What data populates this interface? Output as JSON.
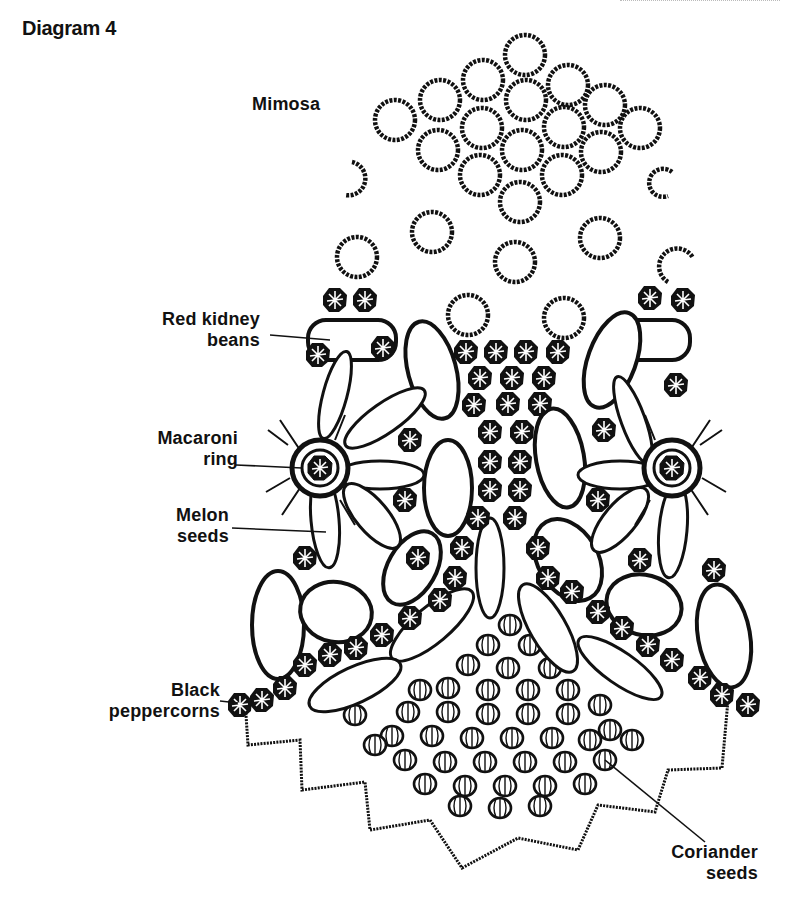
{
  "title": "Diagram 4",
  "labels": {
    "mimosa": {
      "lines": [
        "Mimosa"
      ]
    },
    "red_kidney_beans": {
      "lines": [
        "Red kidney",
        "beans"
      ]
    },
    "macaroni_ring": {
      "lines": [
        "Macaroni",
        "ring"
      ]
    },
    "melon_seeds": {
      "lines": [
        "Melon",
        "seeds"
      ]
    },
    "black_peppercorns": {
      "lines": [
        "Black",
        "peppercorns"
      ]
    },
    "coriander_seeds": {
      "lines": [
        "Coriander",
        "seeds"
      ]
    }
  },
  "colors": {
    "ink": "#111111",
    "paper": "#ffffff"
  }
}
